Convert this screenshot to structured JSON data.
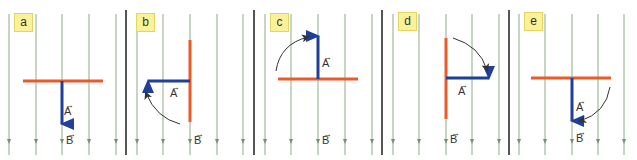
{
  "colors": {
    "field_line": "#8fab8f",
    "divider": "#555555",
    "conductor": "#ec5a2a",
    "vector_A": "#1f3f99",
    "rotation_arrow": "#333333",
    "label_bg": "#fbf19a"
  },
  "panels": [
    {
      "id": "a",
      "label": "a",
      "vector_a_label": "A",
      "field_label": "B",
      "vector_a_direction": "down",
      "conductor_orientation": "horizontal",
      "rotation": "none"
    },
    {
      "id": "b",
      "label": "b",
      "vector_a_label": "A",
      "field_label": "B",
      "vector_a_direction": "left",
      "conductor_orientation": "vertical",
      "rotation": "counterclockwise"
    },
    {
      "id": "c",
      "label": "c",
      "vector_a_label": "A",
      "field_label": "B",
      "vector_a_direction": "up",
      "conductor_orientation": "horizontal",
      "rotation": "clockwise"
    },
    {
      "id": "d",
      "label": "d",
      "vector_a_label": "A",
      "field_label": "B",
      "vector_a_direction": "right",
      "conductor_orientation": "vertical",
      "rotation": "clockwise"
    },
    {
      "id": "e",
      "label": "e",
      "vector_a_label": "A",
      "field_label": "B",
      "vector_a_direction": "down",
      "conductor_orientation": "horizontal",
      "rotation": "clockwise"
    }
  ]
}
